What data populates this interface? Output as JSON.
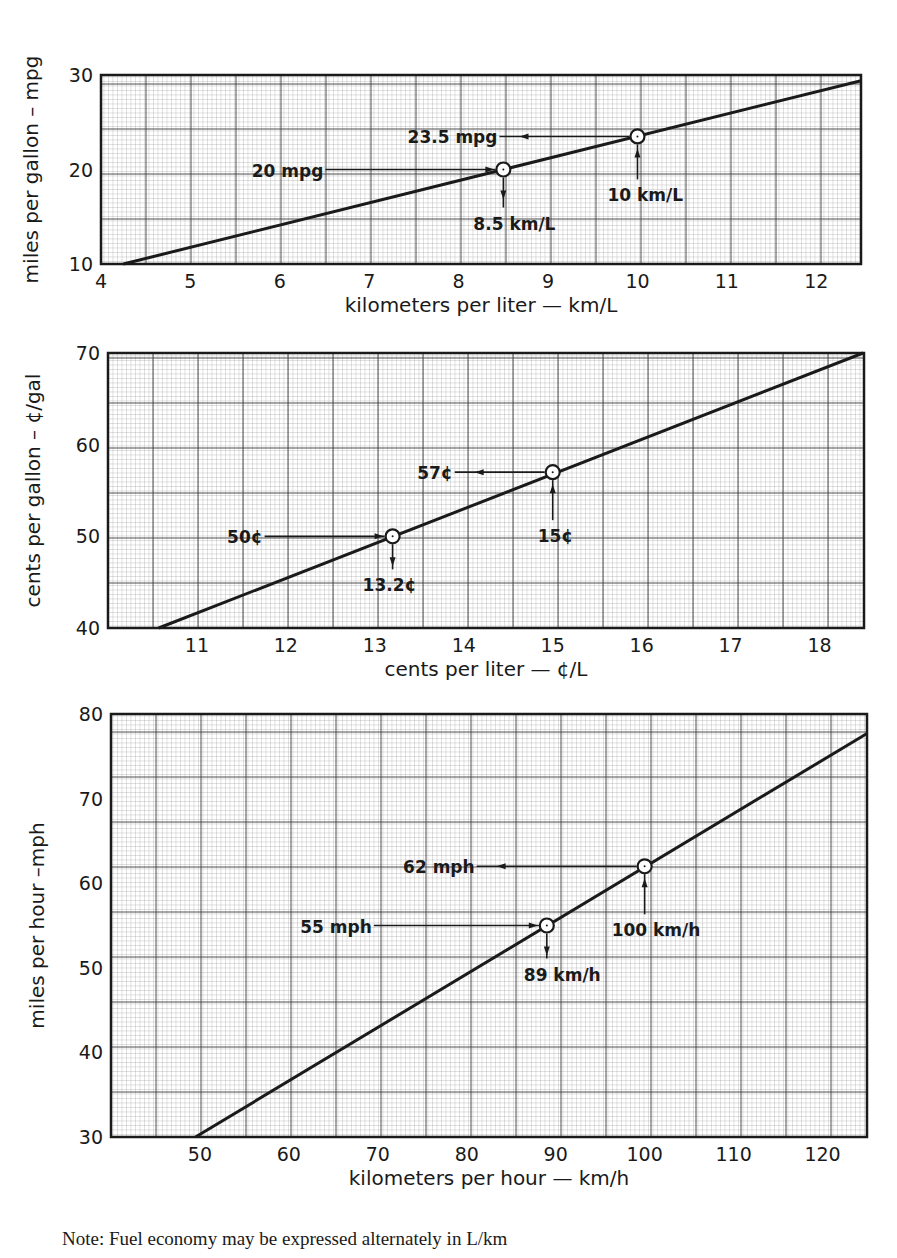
{
  "note": "Note: Fuel economy may be expressed alternately in L/km",
  "colors": {
    "ink": "#1a1a1a",
    "grid_minor": "#8a8a8a",
    "grid_major": "#3a3a3a",
    "paper": "#ffffff"
  },
  "chart_data": [
    {
      "type": "line",
      "title": "",
      "xlabel": "kilometers per liter  —  km/L",
      "ylabel": "miles per gallon – mpg",
      "xlim": [
        4,
        12.5
      ],
      "ylim": [
        10,
        30
      ],
      "x_ticks": [
        4,
        5,
        6,
        7,
        8,
        9,
        10,
        11,
        12
      ],
      "x_tick_labels": [
        "4",
        "5",
        "6",
        "7",
        "8",
        "9",
        "10",
        "11",
        "12"
      ],
      "y_ticks": [
        10,
        20,
        30
      ],
      "y_tick_labels": [
        "10",
        "20",
        "30"
      ],
      "grid": true,
      "series": [
        {
          "name": "conversion",
          "x": [
            4.25,
            12.5
          ],
          "y": [
            10,
            29.4
          ]
        }
      ],
      "points": [
        {
          "x": 8.5,
          "y": 20,
          "y_label": "20 mpg",
          "x_label": "8.5 km/L"
        },
        {
          "x": 10,
          "y": 23.5,
          "y_label": "23.5 mpg",
          "x_label": "10 km/L"
        }
      ],
      "plot_px": {
        "left": 101,
        "right": 861,
        "top": 75,
        "bottom": 264
      }
    },
    {
      "type": "line",
      "title": "",
      "xlabel": "cents per liter  —  ¢/L",
      "ylabel": "cents per gallon –  ¢/gal",
      "xlim": [
        10,
        18.5
      ],
      "ylim": [
        40,
        70
      ],
      "x_ticks": [
        11,
        12,
        13,
        14,
        15,
        16,
        17,
        18
      ],
      "x_tick_labels": [
        "11",
        "12",
        "13",
        "14",
        "15",
        "16",
        "17",
        "18"
      ],
      "y_ticks": [
        40,
        50,
        60,
        70
      ],
      "y_tick_labels": [
        "40",
        "50",
        "60",
        "70"
      ],
      "grid": true,
      "series": [
        {
          "name": "conversion",
          "x": [
            10.57,
            18.49
          ],
          "y": [
            40,
            70
          ]
        }
      ],
      "points": [
        {
          "x": 13.2,
          "y": 50,
          "y_label": "50¢",
          "x_label": "13.2¢"
        },
        {
          "x": 15,
          "y": 57,
          "y_label": "57¢",
          "x_label": "15¢"
        }
      ],
      "plot_px": {
        "left": 108,
        "right": 864,
        "top": 353,
        "bottom": 628
      }
    },
    {
      "type": "line",
      "title": "",
      "xlabel": "kilometers per hour  —  km/h",
      "ylabel": "miles per hour –mph",
      "xlim": [
        40,
        125
      ],
      "ylim": [
        30,
        80
      ],
      "x_ticks": [
        50,
        60,
        70,
        80,
        90,
        100,
        110,
        120
      ],
      "x_tick_labels": [
        "50",
        "60",
        "70",
        "80",
        "90",
        "100",
        "110",
        "120"
      ],
      "y_ticks": [
        30,
        40,
        50,
        60,
        70,
        80
      ],
      "y_tick_labels": [
        "30",
        "40",
        "50",
        "60",
        "70",
        "80"
      ],
      "grid": true,
      "series": [
        {
          "name": "conversion",
          "x": [
            49.5,
            125
          ],
          "y": [
            30,
            77.7
          ]
        }
      ],
      "points": [
        {
          "x": 89,
          "y": 55,
          "y_label": "55 mph",
          "x_label": "89 km/h"
        },
        {
          "x": 100,
          "y": 62,
          "y_label": "62 mph",
          "x_label": "100 km/h"
        }
      ],
      "plot_px": {
        "left": 111,
        "right": 867,
        "top": 714,
        "bottom": 1137
      }
    }
  ]
}
